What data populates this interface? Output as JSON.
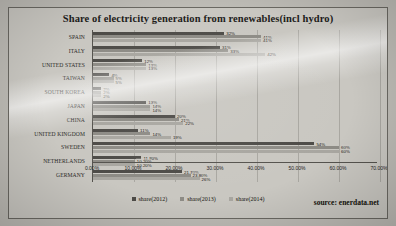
{
  "source_note": "source: enerdata.net",
  "legend": {
    "position": "bottom",
    "items": [
      {
        "label": "share(2012)",
        "color": "#4d4b47"
      },
      {
        "label": "share(2013)",
        "color": "#8d8b85"
      },
      {
        "label": "share(2014)",
        "color": "#a8a6a0"
      }
    ]
  },
  "chart_data": {
    "type": "bar",
    "orientation": "horizontal",
    "title": "Share of electricity generation from renewables(incl hydro)",
    "xlabel": "",
    "ylabel": "",
    "xlim": [
      0,
      70
    ],
    "xticks": [
      "0.00%",
      "10.00%",
      "20.00%",
      "30.00%",
      "40.00%",
      "50.00%",
      "60.00%",
      "70.00%"
    ],
    "grid": true,
    "categories": [
      "SPAIN",
      "ITALY",
      "UNITED STATES",
      "TAIWAN",
      "SOUTH KOREA",
      "JAPAN",
      "CHINA",
      "UNITED KINGDOM",
      "SWEDEN",
      "NETHERLANDS",
      "GERMANY"
    ],
    "series": [
      {
        "name": "share(2012)",
        "color": "#4d4b47",
        "values": [
          32,
          31,
          12,
          4,
          2,
          13,
          20,
          11,
          54,
          11.8,
          21.7
        ],
        "labels": [
          "32%",
          "31%",
          "12%",
          "4%",
          "2%",
          "13%",
          "20%",
          "11%",
          "54%",
          "11.80%",
          "21.70%"
        ]
      },
      {
        "name": "share(2013)",
        "color": "#8d8b85",
        "values": [
          41,
          33,
          13,
          5,
          2,
          14,
          21,
          14,
          60,
          10.2,
          23.8
        ],
        "labels": [
          "41%",
          "33%",
          "13%",
          "5%",
          "2%",
          "14%",
          "21%",
          "14%",
          "60%",
          "10.20%",
          "23.80%"
        ]
      },
      {
        "name": "share(2014)",
        "color": "#a8a6a0",
        "values": [
          41,
          42,
          13,
          5,
          2,
          14,
          22,
          19,
          60,
          10.2,
          26
        ],
        "labels": [
          "41%",
          "42%",
          "13%",
          "5%",
          "2%",
          "14%",
          "22%",
          "19%",
          "60%",
          "10.20%",
          "26%"
        ]
      }
    ]
  }
}
